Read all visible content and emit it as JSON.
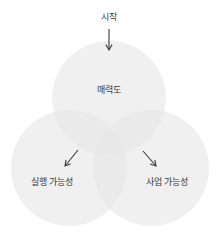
{
  "diagram": {
    "type": "venn",
    "start_label": "시작",
    "circles": [
      {
        "id": "top",
        "label": "매력도",
        "cx": 109,
        "cy": 98,
        "r": 57
      },
      {
        "id": "left",
        "label": "실행 가능성",
        "cx": 69,
        "cy": 168,
        "r": 58
      },
      {
        "id": "right",
        "label": "사업 가능성",
        "cx": 151,
        "cy": 168,
        "r": 58
      }
    ],
    "colors": {
      "circle_fill": "#e6e6e6",
      "circle_opacity": "0.62",
      "text": "#3a3a3a",
      "arrow": "#3a3a3a"
    }
  }
}
